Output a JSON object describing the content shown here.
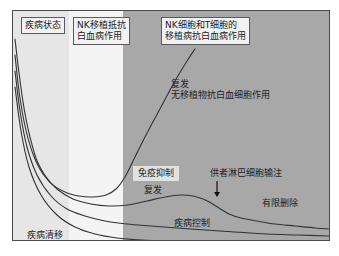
{
  "figure": {
    "title_present": false,
    "background_color": "#ffffff",
    "frame_color": "#4a4a4a"
  },
  "bands": [
    {
      "name": "early-phase",
      "label": "",
      "color": "#e6e6e6",
      "x_start_px": 0,
      "x_end_px": 56
    },
    {
      "name": "mid-phase",
      "label": "",
      "color": "#f4f4f4",
      "x_start_px": 56,
      "x_end_px": 110
    },
    {
      "name": "late-phase",
      "label": "",
      "color": "#a8a8a8",
      "x_start_px": 110,
      "x_end_px": 318
    }
  ],
  "boxed_labels": {
    "disease_state": "疾病状态",
    "nk_resist_leukemia": "NK移植抵抗\n白血病作用",
    "nk_t_gvl": "NK细胞和T细胞的\n移植病抗白血病作用",
    "immunosuppression": "免疫抑制"
  },
  "plain_labels": {
    "relapse_no_gvl": "复发\n无移植物抗白血细胞作用",
    "relapse_mid": "复发",
    "dli": "供者淋巴细胞输注",
    "limited_deletion": "有限删除",
    "disease_control": "疾病控制",
    "remission": "疾病清移"
  },
  "chart_data": {
    "type": "line",
    "title": "",
    "xlabel": "",
    "ylabel": "",
    "grid": false,
    "legend_position": "none",
    "axis_style": "frame-only",
    "xlim": [
      0,
      318
    ],
    "ylim": [
      0,
      231
    ],
    "y_direction": "disease burden, higher = worse",
    "shaded_regions": [
      {
        "name": "NK移植抵抗白血病作用",
        "x_start": 56,
        "x_end": 110,
        "shade": "#f4f4f4"
      },
      {
        "name": "NK细胞和T细胞的移植病抗白血病作用",
        "x_start": 110,
        "x_end": 318,
        "shade": "#a8a8a8"
      }
    ],
    "annotations": [
      {
        "text": "供者淋巴细胞输注",
        "type": "arrow",
        "x": 204,
        "y": 170,
        "arrow_to_x": 204,
        "arrow_to_y": 186
      }
    ],
    "series": [
      {
        "name": "复发 无移植物抗白血细胞作用",
        "color": "#333333",
        "points": [
          [
            2,
            28
          ],
          [
            6,
            62
          ],
          [
            11,
            97
          ],
          [
            17,
            126
          ],
          [
            25,
            152
          ],
          [
            38,
            172
          ],
          [
            52,
            181
          ],
          [
            66,
            185
          ],
          [
            80,
            186
          ],
          [
            93,
            184
          ],
          [
            103,
            178
          ],
          [
            112,
            166
          ],
          [
            122,
            146
          ],
          [
            134,
            122
          ],
          [
            148,
            96
          ],
          [
            162,
            70
          ],
          [
            174,
            50
          ],
          [
            182,
            38
          ]
        ]
      },
      {
        "name": "复发 (供者淋巴细胞输注后有限删除)",
        "color": "#333333",
        "points": [
          [
            2,
            44
          ],
          [
            6,
            80
          ],
          [
            12,
            115
          ],
          [
            20,
            143
          ],
          [
            30,
            163
          ],
          [
            44,
            178
          ],
          [
            60,
            188
          ],
          [
            78,
            193
          ],
          [
            96,
            195
          ],
          [
            115,
            194
          ],
          [
            134,
            190
          ],
          [
            152,
            186
          ],
          [
            168,
            184
          ],
          [
            180,
            185
          ],
          [
            190,
            188
          ],
          [
            198,
            192
          ],
          [
            206,
            197
          ],
          [
            216,
            203
          ],
          [
            228,
            207
          ],
          [
            244,
            210
          ],
          [
            262,
            213
          ],
          [
            282,
            215
          ],
          [
            302,
            217
          ],
          [
            316,
            218
          ]
        ]
      },
      {
        "name": "疾病控制",
        "color": "#333333",
        "points": [
          [
            2,
            60
          ],
          [
            7,
            100
          ],
          [
            14,
            136
          ],
          [
            24,
            164
          ],
          [
            38,
            185
          ],
          [
            54,
            198
          ],
          [
            72,
            205
          ],
          [
            92,
            210
          ],
          [
            114,
            213
          ],
          [
            138,
            215
          ],
          [
            164,
            217
          ],
          [
            192,
            219
          ],
          [
            222,
            221
          ],
          [
            254,
            223
          ],
          [
            284,
            224
          ],
          [
            316,
            225
          ]
        ]
      },
      {
        "name": "疾病清移",
        "color": "#333333",
        "points": [
          [
            2,
            76
          ],
          [
            8,
            120
          ],
          [
            16,
            156
          ],
          [
            28,
            184
          ],
          [
            44,
            204
          ],
          [
            62,
            216
          ],
          [
            82,
            223
          ],
          [
            104,
            227
          ],
          [
            128,
            229
          ],
          [
            156,
            230
          ],
          [
            190,
            230
          ],
          [
            230,
            230
          ],
          [
            275,
            230
          ],
          [
            316,
            230
          ]
        ]
      }
    ]
  }
}
